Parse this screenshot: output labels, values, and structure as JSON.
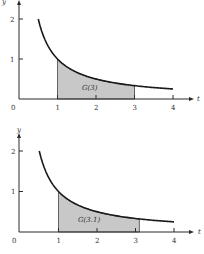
{
  "chart_data": [
    {
      "type": "area",
      "title": "",
      "function": "y = 1/t",
      "xlabel": "t",
      "ylabel": "y",
      "xticks": [
        "1",
        "2",
        "3",
        "4"
      ],
      "yticks": [
        "1",
        "2"
      ],
      "origin_label": "0",
      "xlim": [
        0,
        4.2
      ],
      "ylim": [
        0,
        2.4
      ],
      "curve_range": [
        0.5,
        4
      ],
      "x": [
        0.5,
        1,
        1.5,
        2,
        2.5,
        3,
        3.5,
        4
      ],
      "values": [
        2,
        1,
        0.667,
        0.5,
        0.4,
        0.333,
        0.286,
        0.25
      ],
      "shaded_region": [
        1,
        3
      ],
      "annotation": "G(3)",
      "grid": false
    },
    {
      "type": "area",
      "title": "",
      "function": "y = 1/t",
      "xlabel": "t",
      "ylabel": "y",
      "xticks": [
        "1",
        "2",
        "3",
        "4"
      ],
      "yticks": [
        "1",
        "2"
      ],
      "origin_label": "0",
      "xlim": [
        0,
        4.2
      ],
      "ylim": [
        0,
        2.4
      ],
      "curve_range": [
        0.5,
        4
      ],
      "x": [
        0.5,
        1,
        1.5,
        2,
        2.5,
        3,
        3.5,
        4
      ],
      "values": [
        2,
        1,
        0.667,
        0.5,
        0.4,
        0.333,
        0.286,
        0.25
      ],
      "shaded_region": [
        1,
        3.1
      ],
      "annotation": "G(3.1)",
      "grid": false
    }
  ],
  "plots": [
    {
      "annotation": "G(3)",
      "xlabel": "t",
      "ylabel": "y",
      "origin": "0",
      "xt": [
        "1",
        "2",
        "3",
        "4"
      ],
      "yt": [
        "1",
        "2"
      ]
    },
    {
      "annotation": "G(3.1)",
      "xlabel": "t",
      "ylabel": "y",
      "origin": "0",
      "xt": [
        "1",
        "2",
        "3",
        "4"
      ],
      "yt": [
        "1",
        "2"
      ]
    }
  ]
}
